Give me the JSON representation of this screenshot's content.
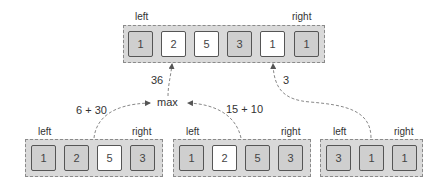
{
  "top_array": {
    "left_label": "left",
    "right_label": "right",
    "cells": [
      {
        "value": "1",
        "shade": "gray"
      },
      {
        "value": "2",
        "shade": "white"
      },
      {
        "value": "5",
        "shade": "white"
      },
      {
        "value": "3",
        "shade": "gray"
      },
      {
        "value": "1",
        "shade": "white"
      },
      {
        "value": "1",
        "shade": "gray"
      }
    ]
  },
  "bottom_left_array": {
    "left_label": "left",
    "right_label": "right",
    "cells": [
      {
        "value": "1",
        "shade": "gray"
      },
      {
        "value": "2",
        "shade": "gray"
      },
      {
        "value": "5",
        "shade": "white"
      },
      {
        "value": "3",
        "shade": "gray"
      }
    ]
  },
  "bottom_middle_array": {
    "left_label": "left",
    "right_label": "right",
    "cells": [
      {
        "value": "1",
        "shade": "gray"
      },
      {
        "value": "2",
        "shade": "white"
      },
      {
        "value": "5",
        "shade": "gray"
      },
      {
        "value": "3",
        "shade": "gray"
      }
    ]
  },
  "bottom_right_array": {
    "left_label": "left",
    "right_label": "right",
    "cells": [
      {
        "value": "3",
        "shade": "gray"
      },
      {
        "value": "1",
        "shade": "gray"
      },
      {
        "value": "1",
        "shade": "gray"
      }
    ]
  },
  "edges": {
    "left_sum": "6 + 30",
    "middle_sum": "15 + 10",
    "max_label": "max",
    "max_result": "36",
    "right_result": "3"
  },
  "colors": {
    "container_fill": "#d9d9d9",
    "cell_gray": "#cfcfcf",
    "cell_white": "#ffffff",
    "arrow": "#777777"
  }
}
